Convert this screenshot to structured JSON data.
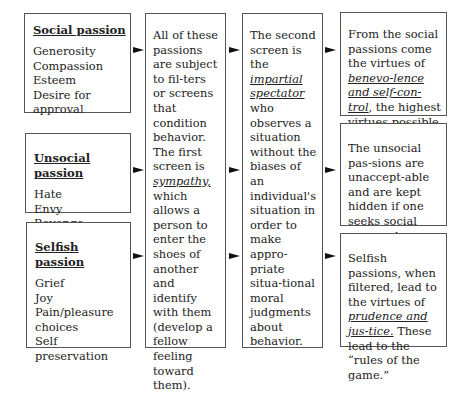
{
  "passions": [
    {
      "heading": "Social passion",
      "items": [
        "Generosity",
        "Compassion",
        "Esteem",
        "Desire for approval"
      ]
    },
    {
      "heading": "Unsocial passion",
      "items": [
        "Hate",
        "Envy",
        "Revenge"
      ]
    },
    {
      "heading": "Selfish passion",
      "items": [
        "Grief",
        "Joy",
        "Pain/pleasure choices",
        "Self preservation"
      ]
    }
  ],
  "filters": {
    "first": {
      "before": "All of these passions are subject to fil-ters or screens that condition behavior. The first screen is ",
      "emphasis": "sympathy,",
      "after": " which allows a person to enter the shoes of another and identify with them (develop a fellow feeling toward them)."
    },
    "second": {
      "before": "The second screen is the ",
      "emphasis": "impartial spectator",
      "after": " who observes a situation without the biases of an individual's situation in order to make appro-priate situa-tional moral judgments about behavior."
    }
  },
  "outcomes": [
    {
      "before": "From the social passions come the virtues of ",
      "emphasis": "benevo-lence and self-con-trol",
      "after": ", the highest virtues possible."
    },
    {
      "before": "The unsocial pas-sions are unaccept-able and are kept hidden if one seeks social approval.",
      "emphasis": "",
      "after": ""
    },
    {
      "before": "Selfish passions, when filtered, lead to the virtues of ",
      "emphasis": "prudence and jus-tice.",
      "after": " These lead to the “rules of the game.”"
    }
  ],
  "colors": {
    "border": "#555555",
    "arrow": "#111111",
    "text": "#222222"
  }
}
